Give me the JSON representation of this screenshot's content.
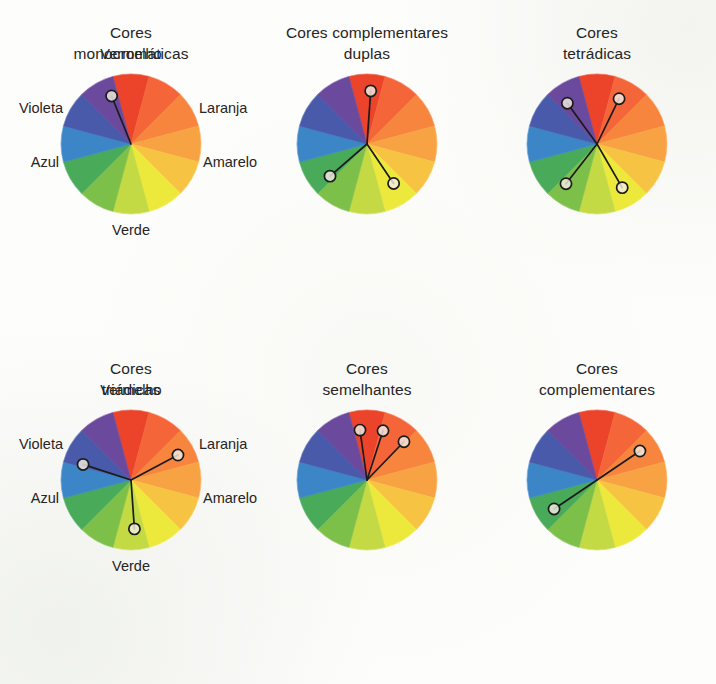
{
  "page": {
    "background_color": "#fdfdfb",
    "text_color": "#272424"
  },
  "wheel": {
    "segment_count": 12,
    "segment_colors": [
      "#e8452c",
      "#f2663a",
      "#f58540",
      "#f7a345",
      "#f6c346",
      "#ece93f",
      "#c3da47",
      "#7ec04b",
      "#4aa95b",
      "#3d86c6",
      "#4a5aa8",
      "#6b4a9c"
    ],
    "segment_names": [
      "vermelho",
      "vermelho-laranja",
      "laranja",
      "laranja-amarelo",
      "amarelo-laranja",
      "amarelo",
      "amarelo-verde",
      "verde-claro",
      "verde",
      "azul",
      "azul-violeta",
      "violeta"
    ],
    "marker_outline_color": "#1b1b1b",
    "marker_fill_color": "#f3ece3",
    "connector_color": "#1b1b1b"
  },
  "hue_labels": {
    "top": "Vermelho",
    "upper_left": "Violeta",
    "lower_left": "Azul",
    "upper_right": "Laranja",
    "lower_right": "Amarelo",
    "bottom": "Verde"
  },
  "diagrams": [
    {
      "id": "monocromaticas",
      "title": "Cores\nmonocromáticas",
      "show_hue_labels": true,
      "markers": [
        {
          "name": "marker-vermelho",
          "angle_deg": -22,
          "radius_pct": 74
        }
      ]
    },
    {
      "id": "complementares-duplas",
      "title": "Cores complementares\nduplas",
      "show_hue_labels": false,
      "markers": [
        {
          "name": "marker-vermelho-laranja",
          "angle_deg": 4,
          "radius_pct": 76
        },
        {
          "name": "marker-azul",
          "angle_deg": -131,
          "radius_pct": 70
        },
        {
          "name": "marker-amarelo-verde",
          "angle_deg": 146,
          "radius_pct": 68
        }
      ]
    },
    {
      "id": "tetradicas",
      "title": "Cores\ntetrádicas",
      "show_hue_labels": false,
      "markers": [
        {
          "name": "marker-vermelho",
          "angle_deg": -36,
          "radius_pct": 72
        },
        {
          "name": "marker-laranja",
          "angle_deg": 26,
          "radius_pct": 72
        },
        {
          "name": "marker-azul",
          "angle_deg": -142,
          "radius_pct": 72
        },
        {
          "name": "marker-verde",
          "angle_deg": 150,
          "radius_pct": 72
        }
      ]
    },
    {
      "id": "triadicas",
      "title": "Cores\ntriádicas",
      "show_hue_labels": true,
      "markers": [
        {
          "name": "marker-violeta",
          "angle_deg": -72,
          "radius_pct": 72
        },
        {
          "name": "marker-laranja",
          "angle_deg": 62,
          "radius_pct": 76
        },
        {
          "name": "marker-verde",
          "angle_deg": 176,
          "radius_pct": 70
        }
      ]
    },
    {
      "id": "semelhantes",
      "title": "Cores\nsemelhantes",
      "show_hue_labels": false,
      "markers": [
        {
          "name": "marker-vermelho",
          "angle_deg": -8,
          "radius_pct": 72
        },
        {
          "name": "marker-vermelho-laranja",
          "angle_deg": 18,
          "radius_pct": 74
        },
        {
          "name": "marker-laranja",
          "angle_deg": 44,
          "radius_pct": 76
        }
      ]
    },
    {
      "id": "complementares",
      "title": "Cores\ncomplementares",
      "show_hue_labels": false,
      "markers": [
        {
          "name": "marker-laranja",
          "angle_deg": 56,
          "radius_pct": 74
        },
        {
          "name": "marker-azul",
          "angle_deg": -124,
          "radius_pct": 74
        }
      ]
    }
  ],
  "layout": {
    "columns": [
      12,
      248,
      478
    ],
    "rows": [
      22,
      358
    ]
  }
}
